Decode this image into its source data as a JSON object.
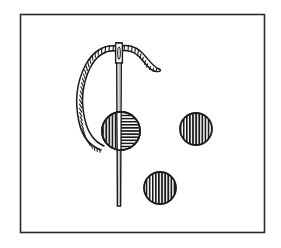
{
  "figure": {
    "type": "line-drawing",
    "background_color": "#ffffff",
    "ink_color": "#1a1a1a",
    "canvas": {
      "width": 281,
      "height": 248
    }
  },
  "frame": {
    "label": "illustration-border",
    "x": 20,
    "y": 14,
    "width": 244,
    "height": 218,
    "stroke_color": "#2b2b2b",
    "stroke_width": 1.6,
    "fill": "#ffffff"
  },
  "needle": {
    "label": "Sewing needle",
    "x_center": 119,
    "top_y": 42,
    "tip_y": 206,
    "shaft_width": 4.5,
    "eye": {
      "label": "needle eye",
      "center_x": 119,
      "center_y": 52,
      "width": 3,
      "height": 12
    },
    "stroke_color": "#1a1a1a"
  },
  "thread": {
    "label": "Twisted thread",
    "texture": "twisted-cord",
    "stroke_color": "#1a1a1a",
    "cord_width": 5,
    "twist_count": 46,
    "loop_description": "Loops from the needle eye leftward, down in a long arc, and back to the right beneath the left bead",
    "tail_description": "Short tail exits the eye to the right, dips and curls back to a small hooked end"
  },
  "beads": [
    {
      "id": "bead-left",
      "label": "Bead on needle",
      "cx": 121,
      "cy": 131,
      "r": 19,
      "hatch": "split-vertical-horizontal",
      "hatch_left": "vertical",
      "hatch_right": "horizontal",
      "on_needle": true,
      "stroke_color": "#1a1a1a"
    },
    {
      "id": "bead-right",
      "label": "Loose bead right",
      "cx": 196,
      "cy": 129,
      "r": 16,
      "hatch": "vertical",
      "on_needle": false,
      "stroke_color": "#1a1a1a"
    },
    {
      "id": "bead-bottom",
      "label": "Loose bead bottom",
      "cx": 160,
      "cy": 188,
      "r": 16,
      "hatch": "vertical",
      "on_needle": false,
      "stroke_color": "#1a1a1a"
    }
  ]
}
